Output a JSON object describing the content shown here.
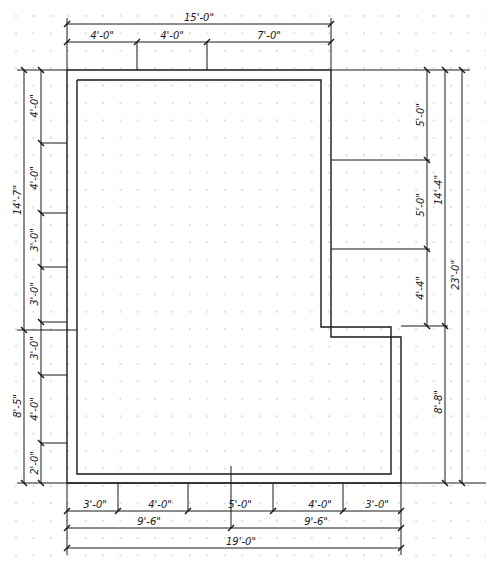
{
  "drawing": {
    "type": "floor-plan",
    "colors": {
      "line": "#1a1a1a",
      "grid_dot": "#b0b0b0",
      "background": "#ffffff"
    },
    "grid": {
      "spacing_px": 17.4,
      "origin_x": 15,
      "origin_y": 15
    }
  },
  "top_dimensions": {
    "overall": {
      "label": "15'-0\""
    },
    "segments": [
      {
        "label": "4'-0\""
      },
      {
        "label": "4'-0\""
      },
      {
        "label": "7'-0\""
      }
    ]
  },
  "left_dimensions": {
    "outer": [
      {
        "label": "14'-7\""
      },
      {
        "label": "8'-5\""
      }
    ],
    "inner": [
      {
        "label": "4'-0\""
      },
      {
        "label": "4'-0\""
      },
      {
        "label": "3'-0\""
      },
      {
        "label": "3'-0\""
      },
      {
        "label": "3'-0\""
      },
      {
        "label": "4'-0\""
      },
      {
        "label": "2'-0\""
      }
    ]
  },
  "right_dimensions": {
    "inner": [
      {
        "label": "5'-0\""
      },
      {
        "label": "5'-0\""
      },
      {
        "label": "4'-4\""
      }
    ],
    "middle": [
      {
        "label": "14'-4\""
      },
      {
        "label": "8'-8\""
      }
    ],
    "overall": {
      "label": "23'-0\""
    }
  },
  "bottom_dimensions": {
    "segments": [
      {
        "label": "3'-0\""
      },
      {
        "label": "4'-0\""
      },
      {
        "label": "5'-0\""
      },
      {
        "label": "4'-0\""
      },
      {
        "label": "3'-0\""
      }
    ],
    "halves": [
      {
        "label": "9'-6\""
      },
      {
        "label": "9'-6\""
      }
    ],
    "overall": {
      "label": "19'-0\""
    }
  }
}
